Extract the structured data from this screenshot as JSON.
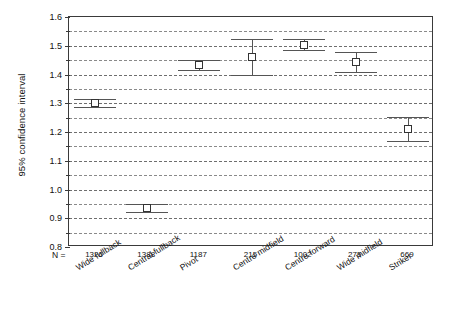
{
  "chart_data": {
    "type": "scatter",
    "title": "",
    "subtitle": "",
    "xlabel": "",
    "ylabel": "95% confidence interval",
    "ylim": [
      0.8,
      1.6
    ],
    "ytick_labels": [
      "0.8",
      "0.9",
      "1.0",
      "1.1",
      "1.2",
      "1.3",
      "1.4",
      "1.5",
      "1.6"
    ],
    "ytick_values": [
      0.8,
      0.9,
      1.0,
      1.1,
      1.2,
      1.3,
      1.4,
      1.5,
      1.6
    ],
    "minor_tick_values": [
      0.85,
      0.95,
      1.05,
      1.15,
      1.25,
      1.35,
      1.45,
      1.55
    ],
    "grid": true,
    "grid_style": "dashed",
    "legend": "none",
    "n_prefix": "N =",
    "categories": [
      "Wide fullback",
      "Central fullback",
      "Pivot",
      "Centre midfield",
      "Centre forward",
      "Wide midfield",
      "Striker"
    ],
    "n_values": [
      "1326",
      "1388",
      "1187",
      "215",
      "1002",
      "275",
      "669"
    ],
    "series": [
      {
        "name": "95% CI of mean",
        "means": [
          1.302,
          0.935,
          1.432,
          1.461,
          1.503,
          1.443,
          1.209
        ],
        "lower": [
          1.288,
          0.922,
          1.414,
          1.399,
          1.484,
          1.408,
          1.167
        ],
        "upper": [
          1.316,
          0.948,
          1.45,
          1.523,
          1.522,
          1.478,
          1.251
        ]
      }
    ]
  },
  "colors": {
    "axis": "#3a3a3a",
    "grid": "#6e6e6e",
    "marker_edge": "#333333",
    "marker_fill": "#ffffff",
    "whisker": "#555555",
    "background": "#ffffff",
    "text": "#111111"
  }
}
